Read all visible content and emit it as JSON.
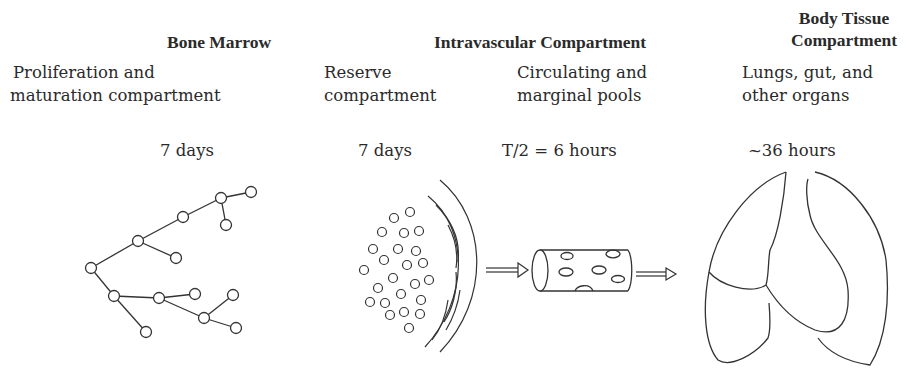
{
  "headers": {
    "bone_marrow": "Bone Marrow",
    "intravascular": "Intravascular Compartment",
    "body_tissue_line1": "Body Tissue",
    "body_tissue_line2": "Compartment"
  },
  "subheaders": {
    "proliferation_line1": "Proliferation and",
    "proliferation_line2": "maturation compartment",
    "reserve_line1": "Reserve",
    "reserve_line2": "compartment",
    "circulating_line1": "Circulating and",
    "circulating_line2": "marginal pools",
    "tissue_line1": "Lungs, gut, and",
    "tissue_line2": "other organs"
  },
  "durations": {
    "proliferation": "7 days",
    "reserve": "7 days",
    "circulating": "T/2 = 6 hours",
    "tissue": "~36 hours"
  },
  "illustrations": {
    "proliferation": "branching-cell-tree",
    "reserve": "cell-cluster-behind-marrow-wall",
    "circulating": "blood-vessel-cylinder-with-cells",
    "tissue": "lungs-outline"
  },
  "colors": {
    "ink": "#2a2a2a",
    "background": "#ffffff"
  }
}
